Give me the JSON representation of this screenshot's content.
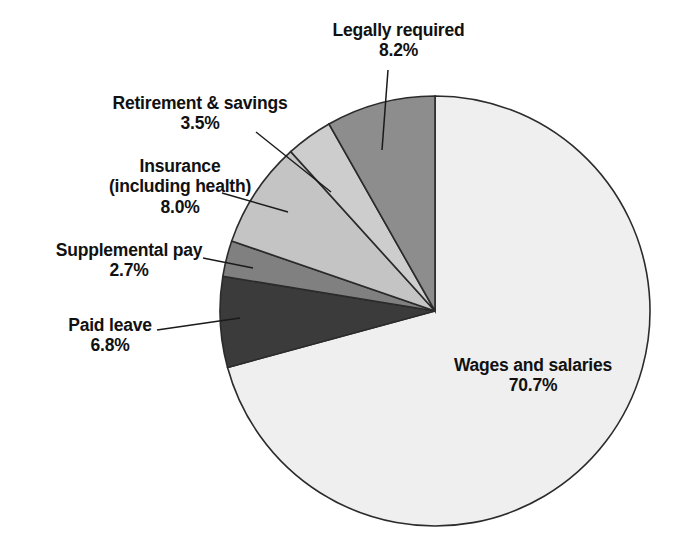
{
  "chart_data": {
    "type": "pie",
    "title": "",
    "subtitle": "",
    "xlabel": "",
    "ylabel": "",
    "legend_position": "none",
    "grid": false,
    "units": "percent",
    "start_angle_deg": 0,
    "direction": "clockwise",
    "categories": [
      "Wages and salaries",
      "Paid leave",
      "Supplemental pay",
      "Insurance (including health)",
      "Retirement & savings",
      "Legally required"
    ],
    "values": [
      70.7,
      6.8,
      2.7,
      8.0,
      3.5,
      8.2
    ],
    "slices": [
      {
        "label": "Wages and salaries",
        "label_line1": "Wages and salaries",
        "label_line2": "",
        "value": 70.7,
        "value_text": "70.7%",
        "color": "#efefef"
      },
      {
        "label": "Paid leave",
        "label_line1": "Paid leave",
        "label_line2": "",
        "value": 6.8,
        "value_text": "6.8%",
        "color": "#3b3b3b"
      },
      {
        "label": "Supplemental pay",
        "label_line1": "Supplemental pay",
        "label_line2": "",
        "value": 2.7,
        "value_text": "2.7%",
        "color": "#808080"
      },
      {
        "label": "Insurance (including health)",
        "label_line1": "Insurance",
        "label_line2": "(including health)",
        "value": 8.0,
        "value_text": "8.0%",
        "color": "#c4c4c4"
      },
      {
        "label": "Retirement & savings",
        "label_line1": "Retirement & savings",
        "label_line2": "",
        "value": 3.5,
        "value_text": "3.5%",
        "color": "#cdcdcd"
      },
      {
        "label": "Legally required",
        "label_line1": "Legally required",
        "label_line2": "",
        "value": 8.2,
        "value_text": "8.2%",
        "color": "#8d8d8d"
      }
    ],
    "colors": [
      "#efefef",
      "#3b3b3b",
      "#808080",
      "#c4c4c4",
      "#cdcdcd",
      "#8d8d8d"
    ],
    "outline_color": "#2b2b2b",
    "text_color": "#111111",
    "background": "#ffffff"
  },
  "labels": {
    "legally_required": {
      "name": "Legally required",
      "value": "8.2%"
    },
    "retirement_savings": {
      "name": "Retirement & savings",
      "value": "3.5%"
    },
    "insurance": {
      "name_line1": "Insurance",
      "name_line2": "(including health)",
      "value": "8.0%"
    },
    "supplemental_pay": {
      "name": "Supplemental pay",
      "value": "2.7%"
    },
    "paid_leave": {
      "name": "Paid leave",
      "value": "6.8%"
    },
    "wages_salaries": {
      "name": "Wages and salaries",
      "value": "70.7%"
    }
  }
}
